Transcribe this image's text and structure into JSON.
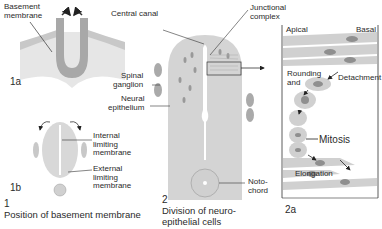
{
  "figure": {
    "panel_1a": {
      "tag": "1a",
      "labels": {
        "basement_membrane": "Basement\nmembrane"
      }
    },
    "panel_1b": {
      "tag": "1b",
      "labels": {
        "internal_limiting": "Internal\nlimiting\nmembrane",
        "external_limiting": "External\nlimiting\nmembrane"
      }
    },
    "panel_1": {
      "number": "1",
      "caption": "Position of basement membrane"
    },
    "panel_2": {
      "number": "2",
      "caption": "Division of neuro-\nepithelial cells",
      "labels": {
        "central_canal": "Central canal",
        "junctional_complex": "Junctional\ncomplex",
        "spinal_ganglion": "Spinal\nganglion",
        "neural_epithelium": "Neural\nepithelium",
        "notochord": "Noto-\nchord"
      }
    },
    "panel_2a": {
      "tag": "2a",
      "labels": {
        "apical": "Apical",
        "basal": "Basal",
        "rounding_and": "Rounding\nand",
        "detachment": "Detachment",
        "mitosis": "Mitosis",
        "elongation": "Elongation"
      }
    },
    "colors": {
      "tissue": "#d8d8d8",
      "tissue_dark": "#b8b8b8",
      "cell": "#cfcfcf",
      "nucleus": "#8f8f8f",
      "line": "#333333",
      "arrow": "#222222"
    }
  }
}
